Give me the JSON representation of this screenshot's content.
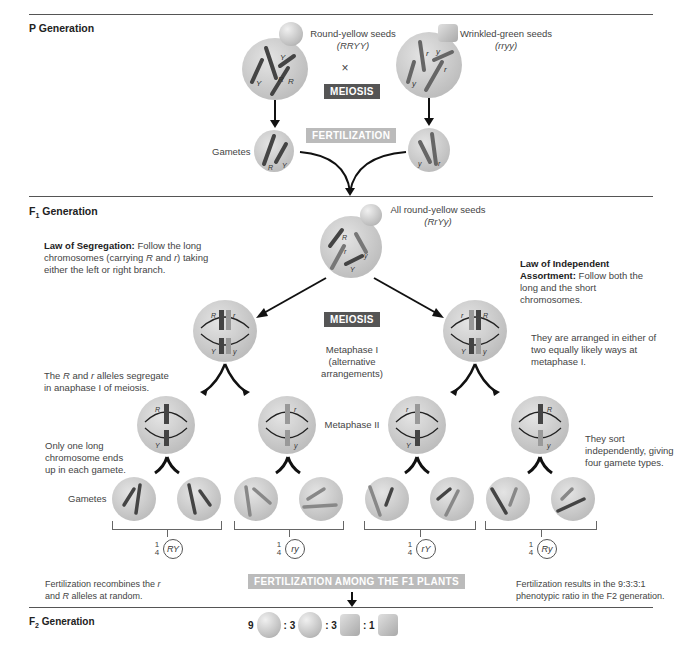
{
  "p_generation": {
    "title": "P Generation",
    "parent1": {
      "label": "Round-yellow seeds",
      "genotype": "(RRYY)",
      "alleles": [
        "Y",
        "Y",
        "R",
        "R"
      ]
    },
    "parent2": {
      "label": "Wrinkled-green seeds",
      "genotype": "(rryy)",
      "alleles": [
        "r",
        "y",
        "y",
        "r"
      ]
    },
    "cross_symbol": "×",
    "meiosis_label": "MEIOSIS",
    "fertilization_label": "FERTILIZATION",
    "gametes_label": "Gametes",
    "gamete1_alleles": [
      "R",
      "Y"
    ],
    "gamete2_alleles": [
      "y",
      "r"
    ]
  },
  "f1_generation": {
    "title": "F",
    "title_sub": "1",
    "title_suffix": " Generation",
    "seed_label": "All round-yellow seeds",
    "genotype": "(RrYy)",
    "law_segregation": {
      "heading": "Law of Segregation:",
      "text_a": " Follow the long chromosomes (carrying ",
      "allele_R": "R",
      "text_b": " and ",
      "allele_r": "r",
      "text_c": ") taking either the left or right branch."
    },
    "law_independent": {
      "heading": "Law of Independent Assortment:",
      "text": " Follow both the long and the short chromosomes."
    },
    "meiosis_label": "MEIOSIS",
    "metaphase1_label": "Metaphase I (alternative arrangements)",
    "metaphase2_label": "Metaphase II",
    "segregate_note_a": "The ",
    "segregate_R": "R",
    "segregate_note_b": " and ",
    "segregate_r": "r",
    "segregate_note_c": " alleles segregate in anaphase I of meiosis.",
    "arranged_note": "They are arranged in either of two equally likely ways at metaphase I.",
    "one_long_note": "Only one long chromosome ends up in each gamete.",
    "sort_note": "They sort independently, giving four gamete types.",
    "gametes_label": "Gametes",
    "gamete_types": [
      {
        "fraction": "1/4",
        "genotype": "RY"
      },
      {
        "fraction": "1/4",
        "genotype": "ry"
      },
      {
        "fraction": "1/4",
        "genotype": "rY"
      },
      {
        "fraction": "1/4",
        "genotype": "Ry"
      }
    ],
    "fertilization_banner": "FERTILIZATION AMONG THE F1 PLANTS",
    "recombine_note_a": "Fertilization recombines the ",
    "recombine_r": "r",
    "recombine_note_b": " and ",
    "recombine_R": "R",
    "recombine_note_c": " alleles at random.",
    "ratio_note": "Fertilization results in the 9:3:3:1 phenotypic ratio in the F2 generation."
  },
  "f2_generation": {
    "title": "F",
    "title_sub": "2",
    "title_suffix": " Generation",
    "ratio": [
      {
        "count": "9",
        "phenotype": "round-yellow"
      },
      {
        "count": ": 3",
        "phenotype": "round-green"
      },
      {
        "count": ": 3",
        "phenotype": "wrinkled-yellow"
      },
      {
        "count": ": 1",
        "phenotype": "wrinkled-green"
      }
    ]
  }
}
